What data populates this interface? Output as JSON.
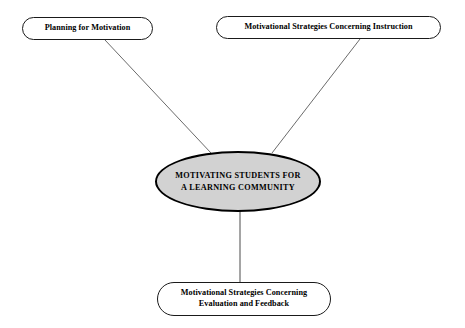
{
  "canvas": {
    "width": 465,
    "height": 328,
    "background": "#ffffff"
  },
  "diagram": {
    "type": "concept-map",
    "center": {
      "id": "motivating-students",
      "label": "MOTIVATING STUDENTS FOR\nA LEARNING COMMUNITY",
      "shape": "ellipse",
      "fill": "#d2d2d2",
      "stroke": "#000000",
      "text_color": "#000000",
      "x": 155,
      "y": 151,
      "width": 166,
      "height": 61
    },
    "nodes": [
      {
        "id": "planning-for-motivation",
        "label": "Planning for Motivation",
        "shape": "rounded-rectangle",
        "fill": "#ffffff",
        "stroke": "#1a1a1a",
        "text_color": "#000000",
        "x": 22,
        "y": 17,
        "width": 131,
        "height": 23
      },
      {
        "id": "strategies-instruction",
        "label": "Motivational Strategies Concerning Instruction",
        "shape": "rounded-rectangle",
        "fill": "#ffffff",
        "stroke": "#1a1a1a",
        "text_color": "#000000",
        "x": 216,
        "y": 16,
        "width": 225,
        "height": 23
      },
      {
        "id": "strategies-evaluation",
        "label": "Motivational Strategies Concerning\nEvaluation and Feedback",
        "shape": "rounded-rectangle",
        "fill": "#ffffff",
        "stroke": "#1a1a1a",
        "text_color": "#000000",
        "x": 157,
        "y": 282,
        "width": 174,
        "height": 34
      }
    ],
    "connectors": [
      {
        "id": "link-planning-to-center",
        "from": "planning-for-motivation",
        "to": "motivating-students",
        "x1": 105,
        "y1": 40,
        "x2": 211,
        "y2": 153,
        "stroke": "#6b6b6b",
        "width": 1
      },
      {
        "id": "link-instruction-to-center",
        "from": "strategies-instruction",
        "to": "motivating-students",
        "x1": 360,
        "y1": 39,
        "x2": 272,
        "y2": 153,
        "stroke": "#6b6b6b",
        "width": 1
      },
      {
        "id": "link-center-to-evaluation",
        "from": "motivating-students",
        "to": "strategies-evaluation",
        "x1": 240,
        "y1": 211,
        "x2": 240,
        "y2": 283,
        "stroke": "#4a4a4a",
        "width": 1
      }
    ]
  }
}
